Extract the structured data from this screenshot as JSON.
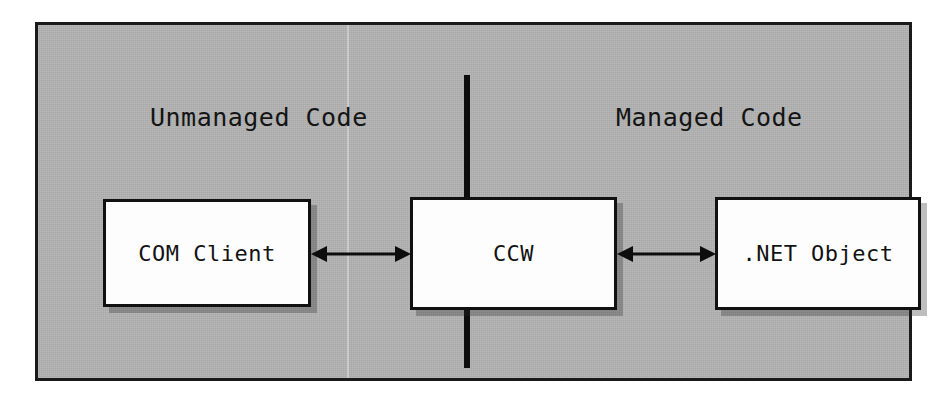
{
  "diagram": {
    "background_color": "#ffffff",
    "panel_color": "#b2b2b2",
    "frame_color": "#1a1a1a",
    "box_fill_color": "#fdfdfd",
    "line_color": "#0d0d0d",
    "regions": [
      {
        "id": "unmanaged",
        "label": "Unmanaged Code"
      },
      {
        "id": "managed",
        "label": "Managed Code"
      }
    ],
    "boxes": [
      {
        "id": "com-client",
        "label": "COM Client",
        "region": "unmanaged"
      },
      {
        "id": "ccw",
        "label": "CCW",
        "region": "boundary"
      },
      {
        "id": "net-object",
        "label": ".NET Object",
        "region": "managed"
      }
    ],
    "connectors": [
      {
        "id": "com-ccw",
        "from": "com-client",
        "to": "ccw",
        "style": "double-headed-arrow"
      },
      {
        "id": "ccw-net",
        "from": "ccw",
        "to": "net-object",
        "style": "double-headed-arrow"
      }
    ],
    "divider": {
      "id": "managed-unmanaged-boundary",
      "orientation": "vertical"
    }
  }
}
